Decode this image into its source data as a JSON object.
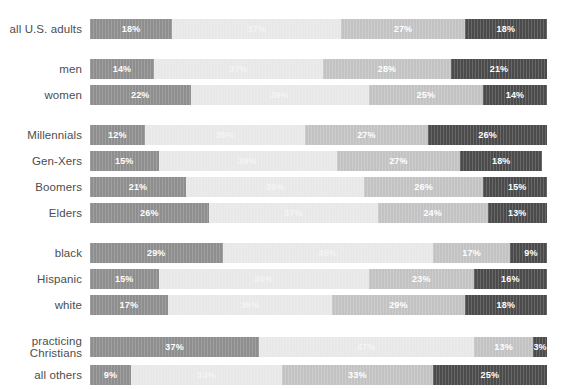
{
  "chart_data": {
    "type": "bar",
    "orientation": "horizontal",
    "stacked": true,
    "stack_total": 100,
    "unit": "%",
    "title": "",
    "subtitle": "",
    "xlabel": "",
    "ylabel": "",
    "xlim": [
      0,
      100
    ],
    "grid": false,
    "legend_position": "none",
    "series": [
      {
        "name": "segment-1",
        "color": "#8e8e8e",
        "values": [
          18,
          14,
          22,
          12,
          15,
          21,
          26,
          29,
          15,
          17,
          37,
          9
        ]
      },
      {
        "name": "segment-2",
        "color": "#e8e8e8",
        "values": [
          37,
          37,
          39,
          35,
          39,
          39,
          37,
          46,
          46,
          36,
          47,
          33
        ]
      },
      {
        "name": "segment-3",
        "color": "#c3c3c3",
        "values": [
          27,
          28,
          25,
          27,
          27,
          26,
          24,
          17,
          23,
          29,
          13,
          33
        ]
      },
      {
        "name": "segment-4",
        "color": "#4b4b4b",
        "values": [
          18,
          21,
          14,
          26,
          18,
          15,
          13,
          9,
          16,
          18,
          3,
          25
        ]
      }
    ],
    "categories": [
      "all U.S. adults",
      "men",
      "women",
      "Millennials",
      "Gen-Xers",
      "Boomers",
      "Elders",
      "black",
      "Hispanic",
      "white",
      "practicing\nChristians",
      "all others"
    ],
    "groups": [
      {
        "name": "overall",
        "rows": [
          {
            "label": "all U.S. adults",
            "two_line": false,
            "segments": [
              {
                "value": 18,
                "text": "18%",
                "color": "#8e8e8e"
              },
              {
                "value": 37,
                "text": "37%",
                "color": "#e8e8e8"
              },
              {
                "value": 27,
                "text": "27%",
                "color": "#c3c3c3"
              },
              {
                "value": 18,
                "text": "18%",
                "color": "#4b4b4b"
              }
            ]
          }
        ]
      },
      {
        "name": "gender",
        "rows": [
          {
            "label": "men",
            "two_line": false,
            "segments": [
              {
                "value": 14,
                "text": "14%",
                "color": "#8e8e8e"
              },
              {
                "value": 37,
                "text": "37%",
                "color": "#e8e8e8"
              },
              {
                "value": 28,
                "text": "28%",
                "color": "#c3c3c3"
              },
              {
                "value": 21,
                "text": "21%",
                "color": "#4b4b4b"
              }
            ]
          },
          {
            "label": "women",
            "two_line": false,
            "segments": [
              {
                "value": 22,
                "text": "22%",
                "color": "#8e8e8e"
              },
              {
                "value": 39,
                "text": "39%",
                "color": "#e8e8e8"
              },
              {
                "value": 25,
                "text": "25%",
                "color": "#c3c3c3"
              },
              {
                "value": 14,
                "text": "14%",
                "color": "#4b4b4b"
              }
            ]
          }
        ]
      },
      {
        "name": "generation",
        "rows": [
          {
            "label": "Millennials",
            "two_line": false,
            "segments": [
              {
                "value": 12,
                "text": "12%",
                "color": "#8e8e8e"
              },
              {
                "value": 35,
                "text": "35%",
                "color": "#e8e8e8"
              },
              {
                "value": 27,
                "text": "27%",
                "color": "#c3c3c3"
              },
              {
                "value": 26,
                "text": "26%",
                "color": "#4b4b4b"
              }
            ]
          },
          {
            "label": "Gen-Xers",
            "two_line": false,
            "segments": [
              {
                "value": 15,
                "text": "15%",
                "color": "#8e8e8e"
              },
              {
                "value": 39,
                "text": "39%",
                "color": "#e8e8e8"
              },
              {
                "value": 27,
                "text": "27%",
                "color": "#c3c3c3"
              },
              {
                "value": 18,
                "text": "18%",
                "color": "#4b4b4b"
              }
            ]
          },
          {
            "label": "Boomers",
            "two_line": false,
            "segments": [
              {
                "value": 21,
                "text": "21%",
                "color": "#8e8e8e"
              },
              {
                "value": 39,
                "text": "39%",
                "color": "#e8e8e8"
              },
              {
                "value": 26,
                "text": "26%",
                "color": "#c3c3c3"
              },
              {
                "value": 15,
                "text": "15%",
                "color": "#4b4b4b"
              }
            ]
          },
          {
            "label": "Elders",
            "two_line": false,
            "segments": [
              {
                "value": 26,
                "text": "26%",
                "color": "#8e8e8e"
              },
              {
                "value": 37,
                "text": "37%",
                "color": "#e8e8e8"
              },
              {
                "value": 24,
                "text": "24%",
                "color": "#c3c3c3"
              },
              {
                "value": 13,
                "text": "13%",
                "color": "#4b4b4b"
              }
            ]
          }
        ]
      },
      {
        "name": "ethnicity",
        "rows": [
          {
            "label": "black",
            "two_line": false,
            "segments": [
              {
                "value": 29,
                "text": "29%",
                "color": "#8e8e8e"
              },
              {
                "value": 46,
                "text": "46%",
                "color": "#e8e8e8"
              },
              {
                "value": 17,
                "text": "17%",
                "color": "#c3c3c3"
              },
              {
                "value": 9,
                "text": "9%",
                "color": "#4b4b4b"
              }
            ]
          },
          {
            "label": "Hispanic",
            "two_line": false,
            "segments": [
              {
                "value": 15,
                "text": "15%",
                "color": "#8e8e8e"
              },
              {
                "value": 46,
                "text": "46%",
                "color": "#e8e8e8"
              },
              {
                "value": 23,
                "text": "23%",
                "color": "#c3c3c3"
              },
              {
                "value": 16,
                "text": "16%",
                "color": "#4b4b4b"
              }
            ]
          },
          {
            "label": "white",
            "two_line": false,
            "segments": [
              {
                "value": 17,
                "text": "17%",
                "color": "#8e8e8e"
              },
              {
                "value": 36,
                "text": "36%",
                "color": "#e8e8e8"
              },
              {
                "value": 29,
                "text": "29%",
                "color": "#c3c3c3"
              },
              {
                "value": 18,
                "text": "18%",
                "color": "#4b4b4b"
              }
            ]
          }
        ]
      },
      {
        "name": "faith",
        "rows": [
          {
            "label": "practicing\nChristians",
            "two_line": true,
            "segments": [
              {
                "value": 37,
                "text": "37%",
                "color": "#8e8e8e"
              },
              {
                "value": 47,
                "text": "47%",
                "color": "#e8e8e8"
              },
              {
                "value": 13,
                "text": "13%",
                "color": "#c3c3c3"
              },
              {
                "value": 3,
                "text": "3%",
                "color": "#4b4b4b"
              }
            ]
          },
          {
            "label": "all others",
            "two_line": false,
            "segments": [
              {
                "value": 9,
                "text": "9%",
                "color": "#8e8e8e"
              },
              {
                "value": 33,
                "text": "33%",
                "color": "#e8e8e8"
              },
              {
                "value": 33,
                "text": "33%",
                "color": "#c3c3c3"
              },
              {
                "value": 25,
                "text": "25%",
                "color": "#4b4b4b"
              }
            ]
          }
        ]
      }
    ]
  }
}
